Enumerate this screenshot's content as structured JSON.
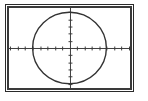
{
  "window": {
    "name": "graphing-calculator-viewing-window",
    "background_color": "#ffffff",
    "frame_color": "#3a3a3a",
    "frame_outer_color": "#2a2a2a"
  },
  "chart_data": {
    "type": "line",
    "title": "",
    "subtitle": "",
    "xlabel": "",
    "ylabel": "",
    "curve_label": "circle",
    "curve_color": "#333333",
    "axis_color": "#3a3a3a",
    "grid": false,
    "legend": "none",
    "xlim": [
      -8.2,
      8.2
    ],
    "ylim": [
      -5.6,
      5.6
    ],
    "x_tick_step": 1,
    "y_tick_step": 1,
    "tick_style": "hash-marks",
    "origin": {
      "x": 0,
      "y": 0
    },
    "series": [
      {
        "name": "circle",
        "shape": "circle",
        "center_x": 0,
        "center_y": 0,
        "radius": 5,
        "equation": "x^2 + y^2 = 25",
        "x": [
          -5.0,
          -4.9,
          -4.6,
          -4.3,
          -3.8,
          -3.2,
          -2.5,
          -1.7,
          -0.9,
          0.0,
          0.9,
          1.7,
          2.5,
          3.2,
          3.8,
          4.3,
          4.6,
          4.9,
          5.0
        ],
        "y_upper": [
          0.0,
          1.0,
          2.0,
          2.6,
          3.3,
          3.8,
          4.3,
          4.7,
          4.9,
          5.0,
          4.9,
          4.7,
          4.3,
          3.8,
          3.3,
          2.6,
          2.0,
          1.0,
          0.0
        ],
        "y_lower": [
          0.0,
          -1.0,
          -2.0,
          -2.6,
          -3.3,
          -3.8,
          -4.3,
          -4.7,
          -4.9,
          -5.0,
          -4.9,
          -4.7,
          -4.3,
          -3.8,
          -3.3,
          -2.6,
          -2.0,
          -1.0,
          0.0
        ]
      }
    ],
    "x_ticks": [
      -8,
      -7,
      -6,
      -5,
      -4,
      -3,
      -2,
      -1,
      1,
      2,
      3,
      4,
      5,
      6,
      7,
      8
    ],
    "y_ticks": [
      -5,
      -4,
      -3,
      -2,
      -1,
      1,
      2,
      3,
      4,
      5
    ],
    "x_tick_labels": [],
    "y_tick_labels": [],
    "annotations": []
  }
}
